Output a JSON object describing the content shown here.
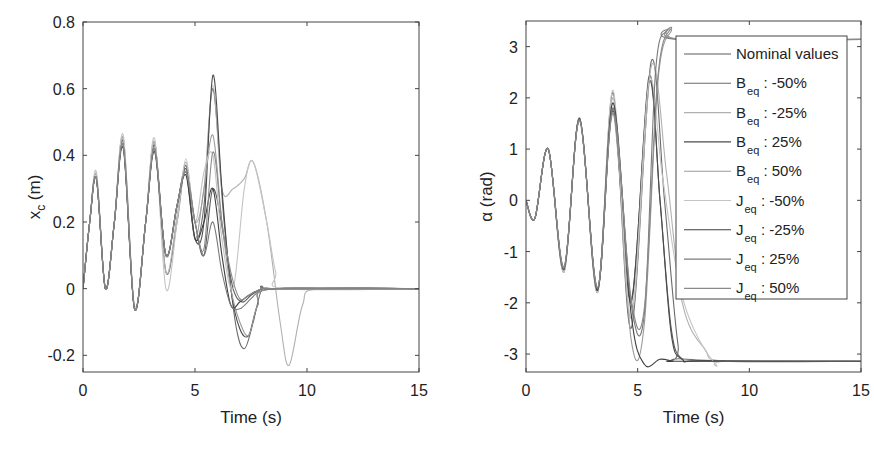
{
  "chart_data": [
    {
      "type": "line",
      "title": "",
      "xlabel": "Time (s)",
      "ylabel": "x_c (m)",
      "ylabel_main": "x",
      "ylabel_sub": "c",
      "ylabel_unit": " (m)",
      "xlim": [
        0,
        15
      ],
      "ylim": [
        -0.25,
        0.8
      ],
      "xticks": [
        0,
        5,
        10,
        15
      ],
      "xtick_labels": [
        "0",
        "5",
        "10",
        "15"
      ],
      "yticks": [
        -0.2,
        0,
        0.2,
        0.4,
        0.6,
        0.8
      ],
      "ytick_labels": [
        "-0.2",
        "0",
        "0.2",
        "0.4",
        "0.6",
        "0.8"
      ],
      "grid": false,
      "legend": false,
      "series": [
        {
          "name": "Nominal values",
          "color": "#5a5a5a",
          "x": [
            0,
            0.3,
            0.6,
            1.0,
            1.4,
            1.8,
            2.3,
            2.8,
            3.2,
            3.7,
            4.2,
            4.6,
            5.0,
            5.4,
            5.8,
            6.3,
            6.7,
            7.1,
            7.5,
            8.0,
            8.5,
            9.0,
            15
          ],
          "y": [
            0,
            0.2,
            0.33,
            0.0,
            0.2,
            0.44,
            -0.06,
            0.2,
            0.43,
            0.1,
            0.25,
            0.36,
            0.2,
            0.1,
            0.3,
            0.15,
            0.0,
            -0.04,
            -0.02,
            0.0,
            0.0,
            0.0,
            0.0
          ]
        },
        {
          "name": "B_eq : -50%",
          "color": "#6a6a6a",
          "x": [
            0,
            0.3,
            0.6,
            1.0,
            1.4,
            1.8,
            2.3,
            2.8,
            3.2,
            3.7,
            4.2,
            4.6,
            5.0,
            5.4,
            5.8,
            6.3,
            6.8,
            7.2,
            7.6,
            8.0,
            8.6,
            15
          ],
          "y": [
            0,
            0.2,
            0.34,
            0.0,
            0.2,
            0.45,
            -0.06,
            0.2,
            0.44,
            0.05,
            0.2,
            0.37,
            0.15,
            0.25,
            0.6,
            0.2,
            -0.1,
            -0.18,
            -0.1,
            0.0,
            0.0,
            0.0
          ]
        },
        {
          "name": "B_eq : -25%",
          "color": "#b0b0b0",
          "x": [
            0,
            0.3,
            0.6,
            1.0,
            1.4,
            1.8,
            2.3,
            2.8,
            3.2,
            3.7,
            4.2,
            4.6,
            5.0,
            5.4,
            5.8,
            6.2,
            6.7,
            7.2,
            7.6,
            8.2,
            8.8,
            9.2,
            9.8,
            10.5,
            15
          ],
          "y": [
            0,
            0.2,
            0.34,
            0.0,
            0.2,
            0.45,
            -0.06,
            0.2,
            0.44,
            0.05,
            0.22,
            0.38,
            0.2,
            0.3,
            0.61,
            0.3,
            0.3,
            0.33,
            0.38,
            0.2,
            -0.1,
            -0.23,
            -0.05,
            0.0,
            0.0
          ]
        },
        {
          "name": "B_eq : 25%",
          "color": "#4a4a4a",
          "x": [
            0,
            0.3,
            0.6,
            1.0,
            1.4,
            1.8,
            2.3,
            2.8,
            3.2,
            3.7,
            4.2,
            4.6,
            5.0,
            5.4,
            5.8,
            6.2,
            6.6,
            7.0,
            7.4,
            7.8,
            8.5,
            15
          ],
          "y": [
            0,
            0.2,
            0.33,
            0.0,
            0.2,
            0.43,
            -0.06,
            0.2,
            0.42,
            0.1,
            0.25,
            0.35,
            0.15,
            0.2,
            0.64,
            0.3,
            0.0,
            -0.12,
            -0.14,
            -0.05,
            0.0,
            0.0
          ]
        },
        {
          "name": "B_eq : 50%",
          "color": "#9a9a9a",
          "x": [
            0,
            0.3,
            0.6,
            1.0,
            1.4,
            1.8,
            2.3,
            2.8,
            3.2,
            3.7,
            4.2,
            4.6,
            5.0,
            5.4,
            5.8,
            6.2,
            6.6,
            7.0,
            7.4,
            7.8,
            8.5,
            15
          ],
          "y": [
            0,
            0.2,
            0.33,
            0.0,
            0.2,
            0.43,
            -0.06,
            0.2,
            0.42,
            0.1,
            0.25,
            0.35,
            0.15,
            0.3,
            0.46,
            0.2,
            0.0,
            -0.1,
            -0.14,
            -0.05,
            0.0,
            0.0
          ]
        },
        {
          "name": "J_eq : -50%",
          "color": "#c4c4c4",
          "x": [
            0,
            0.3,
            0.6,
            1.0,
            1.4,
            1.8,
            2.3,
            2.8,
            3.2,
            3.7,
            4.2,
            4.6,
            5.0,
            5.4,
            5.8,
            6.2,
            6.7,
            7.2,
            7.6,
            8.2,
            8.6,
            9.0,
            15
          ],
          "y": [
            0,
            0.2,
            0.35,
            0.0,
            0.2,
            0.46,
            -0.05,
            0.2,
            0.45,
            0.0,
            0.2,
            0.39,
            0.2,
            0.35,
            0.4,
            0.15,
            0.0,
            0.3,
            0.38,
            0.2,
            0.05,
            0.0,
            0.0
          ]
        },
        {
          "name": "J_eq : -25%",
          "color": "#3f3f3f",
          "x": [
            0,
            0.3,
            0.6,
            1.0,
            1.4,
            1.8,
            2.3,
            2.8,
            3.2,
            3.7,
            4.2,
            4.6,
            5.0,
            5.4,
            5.8,
            6.2,
            6.6,
            7.0,
            7.4,
            8.0,
            8.6,
            15
          ],
          "y": [
            0,
            0.2,
            0.33,
            0.0,
            0.2,
            0.42,
            -0.06,
            0.2,
            0.41,
            0.1,
            0.25,
            0.34,
            0.15,
            0.2,
            0.3,
            0.1,
            -0.05,
            -0.04,
            -0.02,
            0.0,
            0.0,
            0.0
          ]
        },
        {
          "name": "J_eq : 25%",
          "color": "#7a7a7a",
          "x": [
            0,
            0.3,
            0.6,
            1.0,
            1.4,
            1.8,
            2.3,
            2.8,
            3.2,
            3.7,
            4.2,
            4.6,
            5.0,
            5.4,
            5.8,
            6.2,
            6.6,
            7.0,
            7.5,
            8.0,
            8.6,
            15
          ],
          "y": [
            0,
            0.2,
            0.33,
            0.0,
            0.2,
            0.43,
            -0.06,
            0.2,
            0.42,
            0.1,
            0.25,
            0.35,
            0.2,
            0.1,
            0.2,
            0.05,
            -0.05,
            -0.06,
            -0.03,
            0.0,
            0.0,
            0.0
          ]
        },
        {
          "name": "J_eq : 50%",
          "color": "#8a8a8a",
          "x": [
            0,
            0.3,
            0.6,
            1.0,
            1.4,
            1.8,
            2.3,
            2.8,
            3.2,
            3.7,
            4.2,
            4.6,
            5.0,
            5.4,
            5.8,
            6.2,
            6.6,
            7.0,
            7.4,
            8.0,
            8.6,
            15
          ],
          "y": [
            0,
            0.2,
            0.33,
            0.0,
            0.2,
            0.43,
            -0.06,
            0.2,
            0.42,
            0.1,
            0.25,
            0.35,
            0.2,
            0.12,
            0.41,
            0.2,
            0.05,
            -0.03,
            -0.02,
            0.0,
            0.0,
            0.0
          ]
        }
      ]
    },
    {
      "type": "line",
      "title": "",
      "xlabel": "Time (s)",
      "ylabel": "α (rad)",
      "xlim": [
        0,
        15
      ],
      "ylim": [
        -3.35,
        3.5
      ],
      "xticks": [
        0,
        5,
        10,
        15
      ],
      "xtick_labels": [
        "0",
        "5",
        "10",
        "15"
      ],
      "yticks": [
        -3,
        -2,
        -1,
        0,
        1,
        2,
        3
      ],
      "ytick_labels": [
        "-3",
        "-2",
        "-1",
        "0",
        "1",
        "2",
        "3"
      ],
      "grid": false,
      "legend": true,
      "legend_position": "upper right",
      "series": [
        {
          "name": "Nominal values",
          "color": "#5a5a5a",
          "x": [
            0,
            0.4,
            1.0,
            1.7,
            2.4,
            3.2,
            3.9,
            4.7,
            5.5,
            6.0,
            6.5,
            7.0,
            8.0,
            15
          ],
          "y": [
            0,
            -0.35,
            1.0,
            -1.35,
            1.6,
            -1.75,
            1.8,
            -2.0,
            2.4,
            0.0,
            -2.5,
            -3.1,
            -3.13,
            -3.14
          ]
        },
        {
          "name": "B_eq : -50%",
          "color": "#6a6a6a",
          "x": [
            0,
            0.4,
            1.0,
            1.7,
            2.4,
            3.2,
            3.9,
            4.7,
            5.6,
            6.2,
            6.8,
            7.2,
            15
          ],
          "y": [
            0,
            -0.35,
            1.0,
            -1.4,
            1.6,
            -1.8,
            2.1,
            -2.5,
            2.7,
            0.0,
            -2.8,
            -3.1,
            -3.14
          ]
        },
        {
          "name": "B_eq : -25%",
          "color": "#b0b0b0",
          "x": [
            0,
            0.4,
            1.0,
            1.7,
            2.4,
            3.2,
            3.9,
            4.7,
            5.6,
            6.3,
            7.0,
            8.0,
            9.0,
            15
          ],
          "y": [
            0,
            -0.35,
            1.0,
            -1.38,
            1.6,
            -1.78,
            2.0,
            -2.3,
            2.6,
            0.5,
            -2.0,
            -2.9,
            -3.14,
            -3.14
          ]
        },
        {
          "name": "B_eq : 25%",
          "color": "#4a4a4a",
          "x": [
            0,
            0.4,
            1.0,
            1.7,
            2.4,
            3.2,
            3.9,
            4.7,
            5.5,
            6.0,
            6.5,
            7.0,
            8.0,
            15
          ],
          "y": [
            0,
            -0.35,
            1.0,
            -1.33,
            1.58,
            -1.72,
            1.75,
            -1.95,
            2.3,
            0.0,
            -2.6,
            -3.1,
            -3.13,
            -3.14
          ]
        },
        {
          "name": "B_eq : 50%",
          "color": "#9a9a9a",
          "x": [
            0,
            0.4,
            1.0,
            1.7,
            2.4,
            3.2,
            3.9,
            4.7,
            5.3,
            5.9,
            6.5,
            6.9,
            15
          ],
          "y": [
            0,
            -0.35,
            1.0,
            -1.3,
            1.55,
            -1.7,
            1.7,
            -2.7,
            -2.4,
            2.3,
            3.3,
            3.14,
            3.14
          ]
        },
        {
          "name": "J_eq : -50%",
          "color": "#c4c4c4",
          "x": [
            0,
            0.4,
            1.0,
            1.7,
            2.4,
            3.2,
            3.9,
            4.7,
            5.5,
            6.1,
            6.8,
            7.5,
            8.5,
            9.0,
            15
          ],
          "y": [
            0,
            -0.35,
            1.0,
            -1.4,
            1.62,
            -1.8,
            2.15,
            -2.3,
            2.3,
            0.5,
            -1.5,
            -2.5,
            -3.2,
            -3.14,
            -3.14
          ]
        },
        {
          "name": "J_eq : -25%",
          "color": "#3f3f3f",
          "x": [
            0,
            0.4,
            1.0,
            1.7,
            2.4,
            3.2,
            3.9,
            4.7,
            5.3,
            6.0,
            6.6,
            7.0,
            15
          ],
          "y": [
            0,
            -0.35,
            1.0,
            -1.35,
            1.6,
            -1.76,
            1.9,
            -2.2,
            -3.2,
            -3.1,
            -3.14,
            -3.14,
            -3.14
          ]
        },
        {
          "name": "J_eq : 25%",
          "color": "#7a7a7a",
          "x": [
            0,
            0.4,
            1.0,
            1.7,
            2.4,
            3.2,
            3.9,
            4.7,
            5.3,
            5.8,
            6.3,
            6.8,
            15
          ],
          "y": [
            0,
            -0.35,
            1.0,
            -1.33,
            1.58,
            -1.72,
            1.8,
            -2.0,
            -2.2,
            2.5,
            3.3,
            3.14,
            3.14
          ]
        },
        {
          "name": "J_eq : 50%",
          "color": "#8a8a8a",
          "x": [
            0,
            0.4,
            1.0,
            1.7,
            2.4,
            3.2,
            3.9,
            4.7,
            5.3,
            5.9,
            6.5,
            7.0,
            15
          ],
          "y": [
            0,
            -0.35,
            1.0,
            -1.3,
            1.55,
            -1.7,
            1.7,
            -1.9,
            -2.1,
            2.4,
            3.35,
            3.14,
            3.14
          ]
        }
      ]
    }
  ],
  "legend": {
    "items": [
      {
        "main": "Nominal values",
        "sub": "",
        "suffix": ""
      },
      {
        "main": "B",
        "sub": "eq",
        "suffix": " : -50%"
      },
      {
        "main": "B",
        "sub": "eq",
        "suffix": " : -25%"
      },
      {
        "main": "B",
        "sub": "eq",
        "suffix": " : 25%"
      },
      {
        "main": "B",
        "sub": "eq",
        "suffix": " : 50%"
      },
      {
        "main": "J",
        "sub": "eq",
        "suffix": " : -50%"
      },
      {
        "main": "J",
        "sub": "eq",
        "suffix": " : -25%"
      },
      {
        "main": "J",
        "sub": "eq",
        "suffix": " : 25%"
      },
      {
        "main": "J",
        "sub": "eq",
        "suffix": " : 50%"
      }
    ]
  }
}
